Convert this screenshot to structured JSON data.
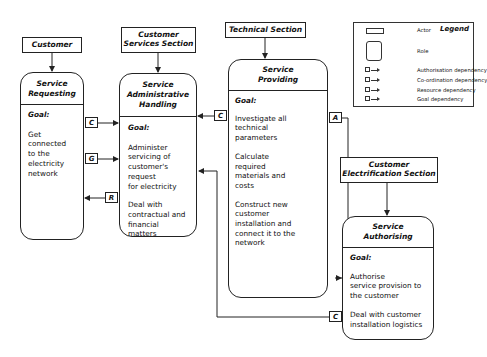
{
  "actors": [
    {
      "id": "customer",
      "label": "Customer"
    },
    {
      "id": "customer-services-section",
      "label": "Customer\nServices Section"
    },
    {
      "id": "technical-section",
      "label": "Technical Section"
    },
    {
      "id": "customer-electrification-section",
      "label": "Customer\nElectrification Section"
    }
  ],
  "roles": [
    {
      "id": "service-requesting",
      "title": "Service\nRequesting",
      "goal_label": "Goal:",
      "goals": [
        "Get\nconnected\nto the\nelectricity\nnetwork"
      ]
    },
    {
      "id": "service-administrative-handling",
      "title": "Service\nAdministrative\nHandling",
      "goal_label": "Goal:",
      "goals": [
        "Administer\nservicing of\ncustomer's request\nfor electricity",
        "Deal with\ncontractual and\nfinancial\nmatters"
      ]
    },
    {
      "id": "service-providing",
      "title": "Service\nProviding",
      "goal_label": "Goal:",
      "goals": [
        "Investigate all\ntechnical\nparameters",
        "Calculate\nrequired\nmaterials and\ncosts",
        "Construct new\ncustomer\ninstallation and\nconnect it to the\nnetwork"
      ]
    },
    {
      "id": "service-authorising",
      "title": "Service\nAuthorising",
      "goal_label": "Goal:",
      "goals": [
        "Authorise\nservice provision to\nthe customer",
        "Deal with customer\ninstallation  logistics"
      ]
    }
  ],
  "dependencies": [
    {
      "type": "C",
      "from": "service-requesting",
      "to": "service-administrative-handling"
    },
    {
      "type": "G",
      "from": "service-requesting",
      "to": "service-administrative-handling"
    },
    {
      "type": "R",
      "from": "service-administrative-handling",
      "to": "service-requesting"
    },
    {
      "type": "C",
      "from": "service-providing",
      "to": "service-administrative-handling"
    },
    {
      "type": "A",
      "from": "service-providing",
      "to": "service-authorising"
    },
    {
      "type": "C",
      "from": "service-authorising",
      "to": "service-administrative-handling"
    }
  ],
  "legend": {
    "title": "Legend",
    "items": [
      {
        "symbol": "actor-rect",
        "label": "Actor"
      },
      {
        "symbol": "role-rounded",
        "label": "Role"
      },
      {
        "symbol": "A",
        "label": "Authorisation dependency"
      },
      {
        "symbol": "C",
        "label": "Co-ordination dependency"
      },
      {
        "symbol": "R",
        "label": "Resource dependency"
      },
      {
        "symbol": "G",
        "label": "Goal dependency"
      }
    ]
  }
}
